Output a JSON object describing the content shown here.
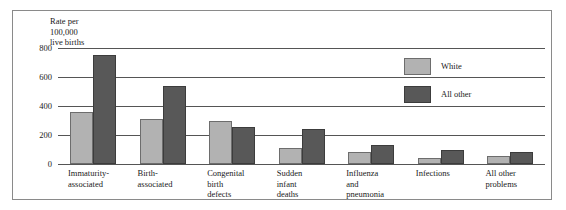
{
  "chart_data": {
    "type": "bar",
    "title": "",
    "subtitle": "",
    "xlabel": "",
    "ylabel": "Rate per\n100,000\nlive births",
    "ylim": [
      0,
      800
    ],
    "yticks": [
      800,
      600,
      400,
      200,
      0
    ],
    "ytick_labels": [
      "800",
      "600",
      "400",
      "200",
      "0"
    ],
    "grid": true,
    "legend_position": "upper right",
    "categories": [
      "Immaturity-\nassociated",
      "Birth-\nassociated",
      "Congenital\nbirth\ndefects",
      "Sudden\ninfant\ndeaths",
      "Influenza\nand\npneumonia",
      "Infections",
      "All other\nproblems"
    ],
    "series": [
      {
        "name": "White",
        "color": "#b2b2b2",
        "values": [
          360,
          310,
          295,
          110,
          80,
          40,
          55
        ]
      },
      {
        "name": "All other",
        "color": "#585858",
        "values": [
          755,
          540,
          255,
          240,
          130,
          100,
          85
        ]
      }
    ]
  },
  "legend": {
    "items": [
      {
        "label": "White",
        "color": "#b2b2b2"
      },
      {
        "label": "All other",
        "color": "#585858"
      }
    ]
  }
}
